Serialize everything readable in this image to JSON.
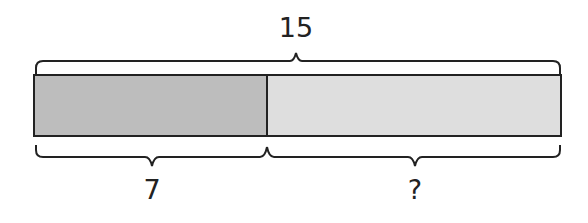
{
  "diagram": {
    "type": "tape-diagram",
    "total": {
      "label": "15"
    },
    "parts": [
      {
        "label": "7",
        "fill": "#bdbdbd"
      },
      {
        "label": "?",
        "fill": "#dedede"
      }
    ],
    "outline_color": "#222222"
  }
}
